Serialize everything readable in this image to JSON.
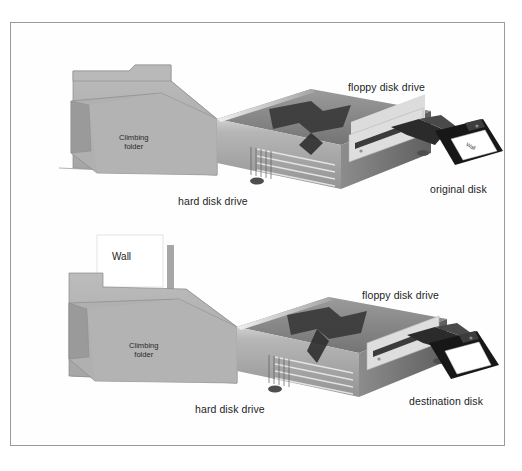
{
  "figure": {
    "domain": "illustration-diagram",
    "border_color": "#9a9a9a",
    "background": "#ffffff"
  },
  "panels": [
    {
      "id": "top",
      "name": "copy-from-original-disk",
      "folder": {
        "label_line1": "Climbing",
        "label_line2": "folder",
        "has_paper": false,
        "paper_label": ""
      },
      "computer": {
        "caption_hard_disk": "hard disk drive",
        "caption_floppy_drive": "floppy disk drive"
      },
      "disk": {
        "caption": "original disk",
        "label_text": "Wall",
        "label_blank": false
      }
    },
    {
      "id": "bottom",
      "name": "copy-to-destination-disk",
      "folder": {
        "label_line1": "Climbing",
        "label_line2": "folder",
        "has_paper": true,
        "paper_label": "Wall"
      },
      "computer": {
        "caption_hard_disk": "hard disk drive",
        "caption_floppy_drive": "floppy disk drive"
      },
      "disk": {
        "caption": "destination disk",
        "label_text": "",
        "label_blank": true
      }
    }
  ],
  "colors": {
    "folder_fill": "#b4b4b4",
    "folder_shade": "#9c9c9c",
    "case_top": "#7e7e7e",
    "case_front": "#a8a8a8",
    "case_side": "#6a6a6a",
    "bezel": "#d8d8d8",
    "disk_body": "#171717",
    "disk_label": "#ffffff",
    "leader_line": "#8d8d8d"
  }
}
